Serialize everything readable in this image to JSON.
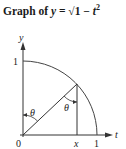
{
  "title": {
    "prefix": "Graph of ",
    "var": "y",
    "eq": " = √1 − ",
    "var2": "t",
    "exp": "2"
  },
  "diagram": {
    "axis_labels": {
      "x": "t",
      "y": "y"
    },
    "ticks": {
      "origin": "0",
      "x_point": "x",
      "x_one": "1",
      "y_one": "1"
    },
    "angle_label": "θ",
    "colors": {
      "line": "#333333",
      "curve": "#444444"
    }
  }
}
